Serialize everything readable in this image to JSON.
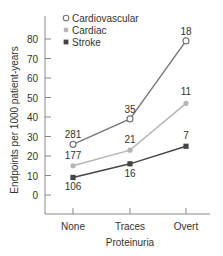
{
  "chart_data": {
    "type": "line",
    "title": "",
    "xlabel": "Proteinuria",
    "ylabel": "Endpoints per 1000 patient-years",
    "categories": [
      "None",
      "Traces",
      "Overt"
    ],
    "yticks": [
      0,
      10,
      20,
      30,
      40,
      50,
      60,
      70,
      80
    ],
    "ylim": [
      -8,
      90
    ],
    "grid": false,
    "legend_position": "top-left inside",
    "series": [
      {
        "name": "Cardiovascular",
        "marker": "open-circle",
        "color": "#777777",
        "values": [
          26,
          39,
          79
        ],
        "labels": [
          "281",
          "35",
          "18"
        ]
      },
      {
        "name": "Cardiac",
        "marker": "filled-circle",
        "color": "#b5b5b5",
        "values": [
          15,
          23,
          47
        ],
        "labels": [
          "177",
          "21",
          "11"
        ]
      },
      {
        "name": "Stroke",
        "marker": "filled-square",
        "color": "#444444",
        "values": [
          9,
          16,
          25
        ],
        "labels": [
          "106",
          "16",
          "7"
        ]
      }
    ]
  }
}
